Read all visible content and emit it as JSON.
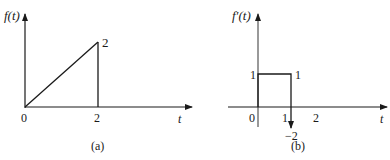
{
  "panel_a": {
    "ylabel": "f(t)",
    "xlabel": "t",
    "caption": "(a)",
    "ticks_x": [
      "0",
      "2"
    ],
    "peak_label": "2",
    "description": "Ramp from (0,0) to (2,2), then drops vertically to 0 at t=2"
  },
  "panel_b": {
    "ylabel": "f′(t)",
    "xlabel": "t",
    "caption": "(b)",
    "ticks_x": [
      "0",
      "1",
      "2"
    ],
    "level_left_label": "1",
    "level_right_label": "1",
    "impulse_label": "−2",
    "description": "Rectangular pulse of height 1 from t=0 to t=2 with an impulse of strength -2 at t=2"
  },
  "colors": {
    "line": "#1a1a1a",
    "axis_b": "#555555"
  }
}
